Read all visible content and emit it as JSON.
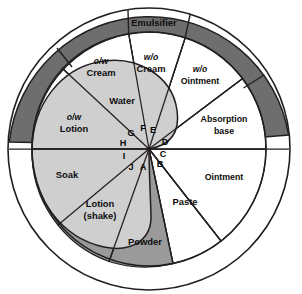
{
  "figure": {
    "name": "dermatologic-vehicle-wheel",
    "background_color": "#ffffff",
    "stroke_color": "#231f20"
  },
  "palette": {
    "white": "#ffffff",
    "light_gray": "#cfcfcf",
    "mid_gray": "#9a9a9a",
    "dark_gray": "#6e6e6e",
    "outline": "#231f20"
  },
  "outer_band": {
    "label": "Emulsifier",
    "fill": "#6e6e6e"
  },
  "segments": [
    {
      "id": "ow-cream",
      "prefix": "o/w",
      "label": "Cream",
      "fill": "#ffffff"
    },
    {
      "id": "wo-cream",
      "prefix": "w/o",
      "label": "Cream",
      "fill": "#ffffff"
    },
    {
      "id": "wo-ointment",
      "prefix": "w/o",
      "label": "Ointment",
      "fill": "#ffffff"
    },
    {
      "id": "absorption-base",
      "prefix": "",
      "label": "Absorption",
      "label2": "base",
      "fill": "#ffffff"
    },
    {
      "id": "ointment",
      "prefix": "",
      "label": "Ointment",
      "fill": "#ffffff"
    },
    {
      "id": "paste",
      "prefix": "",
      "label": "Paste",
      "fill": "#ffffff"
    },
    {
      "id": "powder",
      "prefix": "",
      "label": "Powder",
      "fill": "#9a9a9a"
    },
    {
      "id": "lotion-shake",
      "prefix": "",
      "label": "Lotion",
      "label2": "(shake)",
      "fill": "#cfcfcf"
    },
    {
      "id": "soak",
      "prefix": "",
      "label": "Soak",
      "fill": "#cfcfcf"
    },
    {
      "id": "ow-lotion",
      "prefix": "o/w",
      "label": "Lotion",
      "fill": "#cfcfcf"
    },
    {
      "id": "water",
      "prefix": "",
      "label": "Water",
      "fill": "#cfcfcf"
    }
  ],
  "key_letters": [
    {
      "id": "A",
      "label": "A"
    },
    {
      "id": "B",
      "label": "B"
    },
    {
      "id": "C",
      "label": "C"
    },
    {
      "id": "D",
      "label": "D"
    },
    {
      "id": "E",
      "label": "E"
    },
    {
      "id": "F",
      "label": "F"
    },
    {
      "id": "G",
      "label": "G"
    },
    {
      "id": "H",
      "label": "H"
    },
    {
      "id": "I",
      "label": "I"
    },
    {
      "id": "J",
      "label": "J"
    }
  ]
}
